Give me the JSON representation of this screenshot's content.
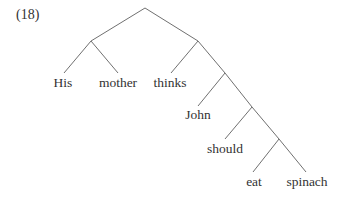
{
  "example_number": "(18)",
  "tree": {
    "edge_color": "#707070",
    "text_color": "#333333",
    "nodes": [
      {
        "id": "n0",
        "x": 145,
        "y": 8
      },
      {
        "id": "n1",
        "x": 91,
        "y": 41
      },
      {
        "id": "n2",
        "x": 198,
        "y": 41
      },
      {
        "id": "n3",
        "x": 225,
        "y": 73
      },
      {
        "id": "n4",
        "x": 252,
        "y": 107
      },
      {
        "id": "n5",
        "x": 279,
        "y": 139
      }
    ],
    "edges": [
      {
        "from": [
          145,
          8
        ],
        "to": [
          91,
          41
        ]
      },
      {
        "from": [
          145,
          8
        ],
        "to": [
          198,
          41
        ]
      },
      {
        "from": [
          91,
          41
        ],
        "to": [
          64,
          73
        ]
      },
      {
        "from": [
          91,
          41
        ],
        "to": [
          118,
          73
        ]
      },
      {
        "from": [
          198,
          41
        ],
        "to": [
          171,
          73
        ]
      },
      {
        "from": [
          198,
          41
        ],
        "to": [
          225,
          73
        ]
      },
      {
        "from": [
          225,
          73
        ],
        "to": [
          198,
          106
        ]
      },
      {
        "from": [
          225,
          73
        ],
        "to": [
          252,
          107
        ]
      },
      {
        "from": [
          252,
          107
        ],
        "to": [
          225,
          139
        ]
      },
      {
        "from": [
          252,
          107
        ],
        "to": [
          279,
          139
        ]
      },
      {
        "from": [
          279,
          139
        ],
        "to": [
          253,
          172
        ]
      },
      {
        "from": [
          279,
          139
        ],
        "to": [
          306,
          172
        ]
      }
    ],
    "leaves": [
      {
        "text": "His",
        "x": 63,
        "y": 89
      },
      {
        "text": "mother",
        "x": 118,
        "y": 89
      },
      {
        "text": "thinks",
        "x": 170,
        "y": 89
      },
      {
        "text": "John",
        "x": 198,
        "y": 121
      },
      {
        "text": "should",
        "x": 225,
        "y": 155
      },
      {
        "text": "eat",
        "x": 254,
        "y": 188
      },
      {
        "text": "spinach",
        "x": 307,
        "y": 188
      }
    ]
  }
}
